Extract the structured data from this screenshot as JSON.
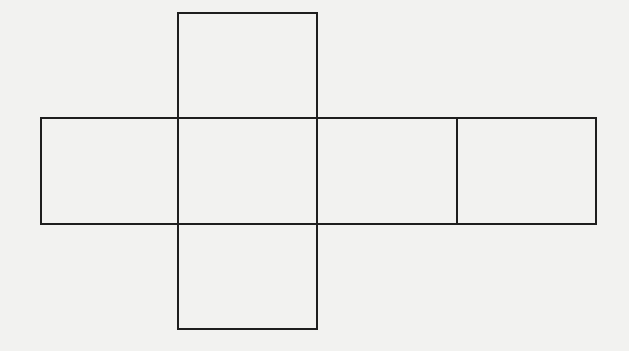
{
  "diagram": {
    "title": "",
    "background_color": "#f2f2f0",
    "stroke_color": "#1e1e1e",
    "stroke_width": 2,
    "faces": [
      {
        "name": "top-face",
        "x": 178,
        "y": 13,
        "w": 139,
        "h": 105
      },
      {
        "name": "left-face",
        "x": 41,
        "y": 118,
        "w": 137,
        "h": 106
      },
      {
        "name": "front-face",
        "x": 178,
        "y": 118,
        "w": 139,
        "h": 106
      },
      {
        "name": "right-face",
        "x": 317,
        "y": 118,
        "w": 140,
        "h": 106
      },
      {
        "name": "back-face",
        "x": 457,
        "y": 118,
        "w": 139,
        "h": 106
      },
      {
        "name": "bottom-face",
        "x": 178,
        "y": 224,
        "w": 139,
        "h": 105
      }
    ]
  }
}
